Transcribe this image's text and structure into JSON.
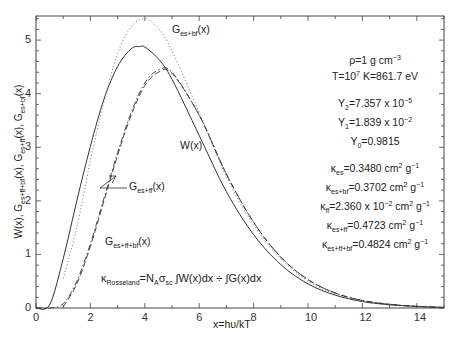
{
  "chart_data": {
    "type": "line",
    "title": "",
    "xlabel": "x = hυ/kT",
    "ylabel": "W(x), G_es+ff+bf(x), G_es+ff(x), G_es+bf(x)",
    "xlim": [
      0,
      15
    ],
    "ylim": [
      0,
      5.45
    ],
    "xticks": [
      0,
      2,
      4,
      6,
      8,
      10,
      12,
      14
    ],
    "yticks": [
      0,
      1,
      2,
      3,
      4,
      5
    ],
    "grid": false,
    "series": [
      {
        "name": "W(x)",
        "style": "solid",
        "x": [
          0,
          0.5,
          1,
          1.5,
          2,
          2.5,
          3,
          3.5,
          3.83,
          4,
          4.5,
          5,
          6,
          7,
          8,
          9,
          10,
          11,
          12,
          13,
          14,
          15
        ],
        "values": [
          0,
          0.06,
          0.92,
          2.0,
          3.02,
          3.9,
          4.51,
          4.84,
          4.88,
          4.87,
          4.65,
          4.27,
          3.22,
          2.17,
          1.37,
          0.81,
          0.45,
          0.24,
          0.12,
          0.06,
          0.03,
          0.01
        ]
      },
      {
        "name": "G_es+bf(x)",
        "style": "dotted",
        "x": [
          1.0,
          1.5,
          2,
          2.5,
          3,
          3.5,
          4,
          4.5,
          5,
          6,
          7,
          8,
          9,
          10,
          11,
          12,
          13,
          14,
          15
        ],
        "values": [
          0.55,
          1.5,
          2.75,
          3.85,
          4.75,
          5.25,
          5.4,
          5.22,
          4.8,
          3.65,
          2.45,
          1.55,
          0.92,
          0.5,
          0.26,
          0.13,
          0.06,
          0.03,
          0.01
        ]
      },
      {
        "name": "G_es+ff(x)",
        "style": "dashdot",
        "x": [
          0,
          0.5,
          1,
          1.5,
          2,
          2.5,
          3,
          3.5,
          4,
          4.5,
          5,
          6,
          7,
          8,
          9,
          10,
          11,
          12,
          13,
          14,
          15
        ],
        "values": [
          0,
          0.0,
          0.08,
          0.5,
          1.2,
          2.05,
          2.9,
          3.65,
          4.2,
          4.44,
          4.4,
          3.6,
          2.5,
          1.6,
          0.95,
          0.53,
          0.28,
          0.14,
          0.07,
          0.03,
          0.01
        ]
      },
      {
        "name": "G_es+ff+bf(x)",
        "style": "dashed",
        "x": [
          1.0,
          1.5,
          2,
          2.5,
          3,
          3.5,
          4,
          4.5,
          5,
          6,
          7,
          8,
          9,
          10,
          11,
          12,
          13,
          14,
          15
        ],
        "values": [
          0.02,
          0.45,
          1.15,
          2.0,
          2.85,
          3.6,
          4.15,
          4.4,
          4.38,
          3.6,
          2.5,
          1.6,
          0.95,
          0.53,
          0.28,
          0.14,
          0.07,
          0.03,
          0.01
        ]
      }
    ],
    "annotations": [
      "G_es+bf(x)",
      "W(x)",
      "G_es+ff(x)",
      "G_es+ff+bf(x)",
      "ρ = 1 g cm^-3",
      "T = 10^7 K = 861.7 eV",
      "Y2 = 7.357 x 10^-5",
      "Y1 = 1.839 x 10^-2",
      "Y0 = 0.9815",
      "κes = 0.3480 cm^2 g^-1",
      "κes+bf = 0.3702 cm^2 g^-1",
      "κff = 2.360 x 10^-2 cm^2 g^-1",
      "κes+ff = 0.4723 cm^2 g^-1",
      "κes+ff+bf = 0.4824 cm^2 g^-1",
      "κRosseland = NA σsc ∫W(x)dx ÷ ∫G(x)dx"
    ],
    "legend_position": "none (inline labels)"
  },
  "labels": {
    "xlabel": "x=hυ/kT",
    "g_es_bf": {
      "main": "G",
      "sub": "es+bf",
      "tail": "(x)"
    },
    "w": "W(x)",
    "g_es_ff": {
      "main": "G",
      "sub": "es+ff",
      "tail": "(x)"
    },
    "g_es_ff_bf": {
      "main": "G",
      "sub": "es+ff+bf",
      "tail": "(x)"
    },
    "ylabel": {
      "p1": "W(x), G",
      "s1": "es+ff+bf",
      "p2": "(x), G",
      "s2": "es+ff",
      "p3": "(x), G",
      "s3": "es+bf",
      "p4": "(x)"
    }
  },
  "info": {
    "rho": {
      "a": "ρ=1 g cm",
      "sup": "−3"
    },
    "temp": {
      "a": "T=10",
      "sup": "7",
      "b": " K=861.7 eV"
    },
    "y2": {
      "a": "Y",
      "sub": "2",
      "b": "=7.357 x 10",
      "sup": "−5"
    },
    "y1": {
      "a": "Y",
      "sub": "1",
      "b": "=1.839 x 10",
      "sup": "−2"
    },
    "y0": {
      "a": "Y",
      "sub": "0",
      "b": "=0.9815"
    },
    "k_es": {
      "a": "κ",
      "sub": "es",
      "b": "=0.3480 cm",
      "sup": "2",
      "c": " g",
      "sup2": "−1"
    },
    "k_es_bf": {
      "a": "κ",
      "sub": "es+bf",
      "b": "=0.3702 cm",
      "sup": "2",
      "c": " g",
      "sup2": "−1"
    },
    "k_ff": {
      "a": "κ",
      "sub": "ff",
      "b": "=2.360 x 10",
      "sup": "−2",
      "c": " cm",
      "sup2": "2",
      "d": " g",
      "sup3": "−1"
    },
    "k_es_ff": {
      "a": "κ",
      "sub": "es+ff",
      "b": "=0.4723 cm",
      "sup": "2",
      "c": " g",
      "sup2": "−1"
    },
    "k_es_ff_bf": {
      "a": "κ",
      "sub": "es+ff+bf",
      "b": "=0.4824 cm",
      "sup": "2",
      "c": " g",
      "sup2": "−1"
    }
  },
  "formula": {
    "k": "κ",
    "ksub": "Rosseland",
    "eq": "=N",
    "nsub": "A",
    "sigma": "σ",
    "ssub": "sc",
    "w": " ∫W(x)dx ÷ ∫G(x)dx"
  }
}
